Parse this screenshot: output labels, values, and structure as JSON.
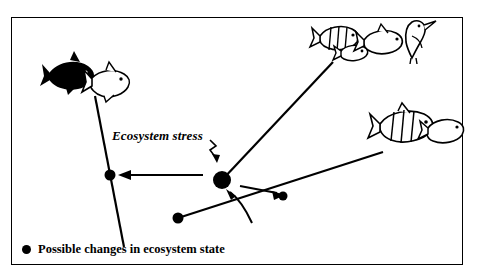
{
  "diagram": {
    "title_label": "Ecosystem stress",
    "legend": {
      "marker": "filled-circle",
      "text": "Possible changes in ecosystem state"
    },
    "frame": {
      "x": 11,
      "y": 17,
      "width": 452,
      "height": 248,
      "border_color": "#000000"
    },
    "nodes": [
      {
        "id": "center",
        "name": "central-state-node",
        "x": 222,
        "y": 180,
        "r": 9
      },
      {
        "id": "left",
        "name": "left-state-node",
        "x": 110,
        "y": 175,
        "r": 5.5
      },
      {
        "id": "lower",
        "name": "lower-state-node",
        "x": 178,
        "y": 218,
        "r": 5.5
      },
      {
        "id": "right",
        "name": "right-state-node",
        "x": 283,
        "y": 196,
        "r": 4.5
      }
    ],
    "trajectories": [
      {
        "name": "left-branch-line",
        "from": [
          95,
          96
        ],
        "to": [
          124,
          247
        ]
      },
      {
        "name": "upper-right-branch-line",
        "from": [
          222,
          180
        ],
        "to": [
          333,
          62
        ]
      },
      {
        "name": "lower-right-branch-line",
        "from": [
          178,
          218
        ],
        "to": [
          383,
          152
        ]
      }
    ],
    "arrows": [
      {
        "name": "arrow-to-left-node",
        "from": [
          200,
          175
        ],
        "to": [
          122,
          175
        ]
      },
      {
        "name": "arrow-to-right-node",
        "from": [
          240,
          186
        ],
        "to": [
          281,
          194
        ]
      },
      {
        "name": "curved-arrow-to-center",
        "from": [
          245,
          222
        ],
        "to": [
          228,
          192
        ]
      },
      {
        "name": "stress-pointer-arrow",
        "from": [
          212,
          143
        ],
        "to": [
          215,
          160
        ]
      }
    ],
    "organisms": [
      {
        "name": "fish-dark-upper-left",
        "x": 48,
        "y": 66,
        "w": 46,
        "h": 26,
        "fill": "#000000"
      },
      {
        "name": "fish-outline-upper-left",
        "x": 86,
        "y": 72,
        "w": 44,
        "h": 30,
        "fill": "#ffffff"
      },
      {
        "name": "fish-striped-top-right-a",
        "x": 317,
        "y": 26,
        "w": 44,
        "h": 22,
        "fill": "#ffffff"
      },
      {
        "name": "fish-small-top-right",
        "x": 338,
        "y": 44,
        "w": 30,
        "h": 16,
        "fill": "#ffffff"
      },
      {
        "name": "fish-outline-top-right-b",
        "x": 358,
        "y": 30,
        "w": 44,
        "h": 24,
        "fill": "#ffffff"
      },
      {
        "name": "bird-top-right",
        "x": 398,
        "y": 18,
        "w": 36,
        "h": 40,
        "fill": "#ffffff"
      },
      {
        "name": "fish-striped-right",
        "x": 376,
        "y": 110,
        "w": 62,
        "h": 30,
        "fill": "#ffffff"
      },
      {
        "name": "fish-outline-right",
        "x": 424,
        "y": 120,
        "w": 40,
        "h": 26,
        "fill": "#ffffff"
      }
    ]
  }
}
